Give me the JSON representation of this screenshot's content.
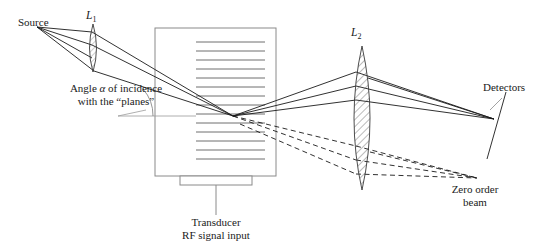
{
  "figure": {
    "title_text": "",
    "labels": {
      "source": "Source",
      "lens1": "L",
      "lens1_sub": "1",
      "lens2": "L",
      "lens2_sub": "2",
      "angle_line1_pre": "Angle ",
      "angle_symbol": "α",
      "angle_line1_post": " of incidence",
      "angle_line2": "with the “planes”",
      "detectors": "Detectors",
      "zero_order_line1": "Zero order",
      "zero_order_line2": "beam",
      "transducer_line1": "Transducer",
      "transducer_line2": "RF signal input"
    },
    "colors": {
      "ink": "#1a1a1a",
      "ray": "#1a1a1a",
      "cell_outline": "#8a8a8a",
      "acoustic_plane": "#6f6f6f",
      "lens_hatch": "#4a4a4a",
      "background": "#ffffff",
      "leader": "#8a8a8a"
    },
    "geometry": {
      "source_point": [
        37,
        27
      ],
      "lens1": {
        "cx": 93,
        "cy": 48,
        "half_height": 24,
        "half_width": 5
      },
      "cell": {
        "x": 155,
        "y": 28,
        "width": 121,
        "height": 148
      },
      "transducer": {
        "x": 180,
        "y": 176,
        "width": 72,
        "height": 9
      },
      "transducer_lead": [
        [
          216,
          185
        ],
        [
          216,
          215
        ]
      ],
      "acoustic_planes_x": [
        196,
        265
      ],
      "acoustic_planes_count": 16,
      "bragg_point": [
        233,
        116
      ],
      "lens2": {
        "cx": 362,
        "cy": 118,
        "half_height": 72,
        "half_width": 14
      },
      "detector_line": [
        [
          504,
          96
        ],
        [
          488,
          156
        ]
      ],
      "detector_focus": [
        494,
        119
      ],
      "zero_order_focus": [
        477,
        178
      ]
    },
    "elements": {
      "diffracted_rays": "solid",
      "zero_order_rays": "dashed",
      "acoustic_planes": "horizontal-lines",
      "lens_style": "hatched-biconvex"
    }
  }
}
